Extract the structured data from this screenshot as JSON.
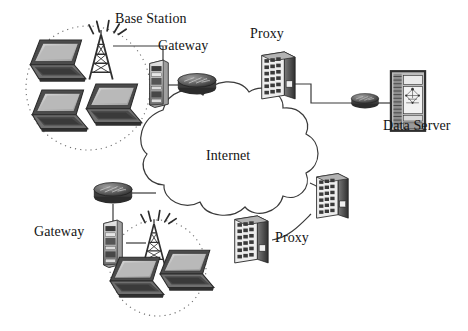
{
  "figure": {
    "kind": "network-topology-diagram",
    "background_color": "#ffffff",
    "stroke_color": "#3a3a3a",
    "text_color": "#141414",
    "width": 468,
    "height": 331
  },
  "labels": {
    "base_station": "Base Station",
    "gateway_top": "Gateway",
    "proxy_top": "Proxy",
    "data_server": "Data Server",
    "internet": "Internet",
    "gateway_bottom": "Gateway",
    "proxy_bottom": "Proxy"
  },
  "nodes": [
    {
      "id": "cell-top",
      "type": "wireless-cell",
      "label": "",
      "x": 88,
      "y": 88
    },
    {
      "id": "laptop-top-1",
      "type": "laptop",
      "label": "",
      "x": 54,
      "y": 57
    },
    {
      "id": "laptop-top-2",
      "type": "laptop",
      "label": "",
      "x": 53,
      "y": 104
    },
    {
      "id": "laptop-top-3",
      "type": "laptop",
      "label": "",
      "x": 109,
      "y": 100
    },
    {
      "id": "tower-top",
      "type": "antenna-tower",
      "label": "Base Station",
      "x": 100,
      "y": 55
    },
    {
      "id": "gateway-top",
      "type": "gateway-server",
      "label": "Gateway",
      "x": 155,
      "y": 78
    },
    {
      "id": "router-top",
      "type": "router",
      "label": "",
      "x": 186,
      "y": 72
    },
    {
      "id": "proxy-top",
      "type": "proxy-switch",
      "label": "Proxy",
      "x": 276,
      "y": 70
    },
    {
      "id": "internet",
      "type": "cloud",
      "label": "Internet",
      "x": 232,
      "y": 160
    },
    {
      "id": "router-right",
      "type": "router",
      "label": "",
      "x": 362,
      "y": 98
    },
    {
      "id": "data-server",
      "type": "data-server",
      "label": "Data Server",
      "x": 406,
      "y": 89
    },
    {
      "id": "proxy-right",
      "type": "proxy-switch",
      "label": "",
      "x": 327,
      "y": 195
    },
    {
      "id": "proxy-bottom",
      "type": "proxy-switch",
      "label": "Proxy",
      "x": 248,
      "y": 235
    },
    {
      "id": "router-bottom",
      "type": "router",
      "label": "",
      "x": 105,
      "y": 191
    },
    {
      "id": "gateway-bottom",
      "type": "gateway-server",
      "label": "Gateway",
      "x": 105,
      "y": 232
    },
    {
      "id": "tower-bottom",
      "type": "antenna-tower",
      "label": "",
      "x": 152,
      "y": 237
    },
    {
      "id": "cell-bottom",
      "type": "wireless-cell",
      "label": "",
      "x": 155,
      "y": 268
    },
    {
      "id": "laptop-bot-1",
      "type": "laptop",
      "label": "",
      "x": 133,
      "y": 275
    },
    {
      "id": "laptop-bot-2",
      "type": "laptop",
      "label": "",
      "x": 182,
      "y": 270
    }
  ],
  "links": [
    {
      "from": "tower-top",
      "to": "gateway-top",
      "style": "solid"
    },
    {
      "from": "gateway-top",
      "to": "router-top",
      "style": "solid"
    },
    {
      "from": "router-top",
      "to": "internet",
      "style": "solid"
    },
    {
      "from": "proxy-top",
      "to": "internet",
      "style": "solid"
    },
    {
      "from": "proxy-top",
      "to": "router-right",
      "style": "solid"
    },
    {
      "from": "router-right",
      "to": "data-server",
      "style": "solid"
    },
    {
      "from": "internet",
      "to": "proxy-right",
      "style": "solid"
    },
    {
      "from": "internet",
      "to": "proxy-bottom",
      "style": "solid"
    },
    {
      "from": "proxy-bottom",
      "to": "proxy-right",
      "style": "solid"
    },
    {
      "from": "internet",
      "to": "router-bottom",
      "style": "solid"
    },
    {
      "from": "router-bottom",
      "to": "gateway-bottom",
      "style": "solid"
    },
    {
      "from": "gateway-bottom",
      "to": "tower-bottom",
      "style": "solid"
    }
  ]
}
